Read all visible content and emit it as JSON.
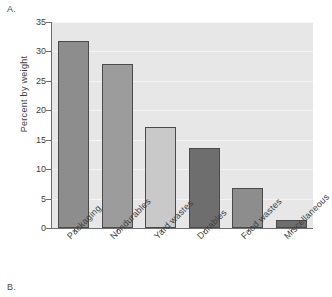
{
  "panels": {
    "top_label": "A.",
    "bottom_label": "B."
  },
  "chart_data": {
    "type": "bar",
    "title": "",
    "xlabel": "",
    "ylabel": "Percent by weight",
    "ylim": [
      0,
      35
    ],
    "yticks": [
      0,
      5,
      10,
      15,
      20,
      25,
      30,
      35
    ],
    "ytick_labels": [
      "0",
      "5",
      "10",
      "15",
      "20",
      "25",
      "30",
      "35"
    ],
    "grid": true,
    "legend": "none",
    "categories": [
      "Packaging",
      "Nondurables",
      "Yard wastes",
      "Durables",
      "Food wastes",
      "Miscellaneous"
    ],
    "values": [
      31.8,
      27.9,
      17.1,
      13.6,
      6.8,
      1.3
    ],
    "bar_colors": [
      "#8d8d8d",
      "#9c9c9c",
      "#c9c9c9",
      "#6e6e6e",
      "#8d8d8d",
      "#6e6e6e"
    ],
    "bar_edge_color": "#4a4a4a",
    "plot_background": "#e7e7e7",
    "gridline_color": "#f4f4f4",
    "axis_color": "#6f6f6f"
  }
}
